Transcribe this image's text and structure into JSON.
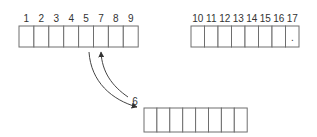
{
  "diagram": {
    "colors": {
      "stroke": "#6e6e6e",
      "text": "#333333",
      "arrow": "#444444"
    },
    "array_top_left": {
      "labels": [
        "1",
        "2",
        "3",
        "4",
        "5",
        "7",
        "8",
        "9"
      ],
      "x": 19,
      "y": 26,
      "cell_w": 14.9,
      "cell_h": 21
    },
    "array_top_right": {
      "labels": [
        "10",
        "11",
        "12",
        "13",
        "14",
        "15",
        "16",
        "17"
      ],
      "x": 191,
      "y": 26,
      "cell_w": 13.5,
      "cell_h": 21,
      "last_cell_mark": "."
    },
    "array_bottom": {
      "label": "6",
      "cells": 8,
      "x": 144,
      "y": 108,
      "cell_w": 12.9,
      "cell_h": 24
    },
    "arrows": [
      {
        "name": "down-arrow",
        "from": "cell 5",
        "to": "bottom array"
      },
      {
        "name": "up-arrow",
        "from": "6",
        "to": "cell 7"
      }
    ]
  }
}
